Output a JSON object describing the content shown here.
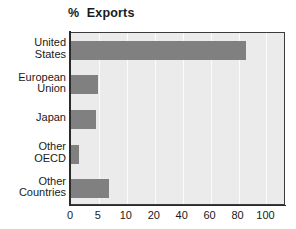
{
  "chart_data": {
    "type": "bar",
    "orientation": "horizontal",
    "title_parts": {
      "symbol": "%",
      "word": "Exports"
    },
    "xlabel": "",
    "ylabel": "",
    "categories": [
      "United States",
      "European Union",
      "Japan",
      "Other OECD",
      "Other Countries"
    ],
    "category_lines": [
      [
        "United",
        "States"
      ],
      [
        "European",
        "Union"
      ],
      [
        "Japan"
      ],
      [
        "Other",
        "OECD"
      ],
      [
        "Other",
        "Countries"
      ]
    ],
    "values": [
      85,
      4.9,
      4.4,
      1.5,
      6.8
    ],
    "xticks": [
      0,
      5,
      10,
      20,
      40,
      60,
      80,
      100
    ],
    "xtick_labels": [
      "0",
      "5",
      "10",
      "20",
      "40",
      "60",
      "80",
      "100"
    ],
    "xlim": [
      0,
      100
    ],
    "x_scale": "ordinal-compressed",
    "grid": true,
    "grid_axis": "x",
    "legend": null,
    "colors": {
      "bar": "#808080",
      "plot_background": "#ebebeb",
      "figure_background": "#ffffff",
      "axis": "#2b2b2b",
      "gridline": "#fbfbfb",
      "text": "#1a1a1a"
    }
  }
}
